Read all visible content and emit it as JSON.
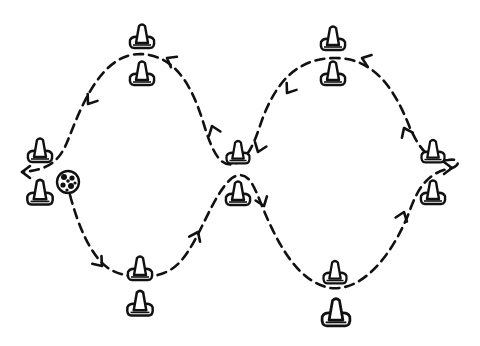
{
  "diagram": {
    "title": "Figure-eight dribbling drill through cone gates",
    "background": "#ffffff",
    "ink_color": "#111111",
    "ball": {
      "icon": "soccer-ball-icon",
      "x": 68,
      "y": 182,
      "r": 11
    },
    "cones": [
      {
        "id": "left-top",
        "x": 40,
        "y": 150,
        "size": 1.0
      },
      {
        "id": "left-bottom",
        "x": 40,
        "y": 192,
        "size": 1.05
      },
      {
        "id": "gate1-top-upper",
        "x": 142,
        "y": 36,
        "size": 1.0
      },
      {
        "id": "gate1-top-lower",
        "x": 142,
        "y": 73,
        "size": 1.0
      },
      {
        "id": "gate1-bottom-upper",
        "x": 140,
        "y": 268,
        "size": 1.0
      },
      {
        "id": "gate1-bottom-lower",
        "x": 140,
        "y": 303,
        "size": 1.05
      },
      {
        "id": "center-upper",
        "x": 238,
        "y": 152,
        "size": 0.95
      },
      {
        "id": "center-lower",
        "x": 238,
        "y": 193,
        "size": 1.0
      },
      {
        "id": "gate2-top-upper",
        "x": 333,
        "y": 38,
        "size": 1.0
      },
      {
        "id": "gate2-top-lower",
        "x": 333,
        "y": 73,
        "size": 1.0
      },
      {
        "id": "gate2-bottom-upper",
        "x": 335,
        "y": 272,
        "size": 0.95
      },
      {
        "id": "gate2-bottom-lower",
        "x": 336,
        "y": 312,
        "size": 1.15
      },
      {
        "id": "right-upper",
        "x": 433,
        "y": 151,
        "size": 0.95
      },
      {
        "id": "right-lower",
        "x": 433,
        "y": 192,
        "size": 1.0
      }
    ],
    "path": {
      "style": "dashed",
      "description": "Dribble path starting at ball, weaving down-right through gates in a figure-eight, looping around the right gate and returning left over the top, ending with arrow pointing left at the start gate.",
      "d": "M 70 195 C 78 225, 90 255, 108 268 C 122 278, 160 284, 180 262 C 200 240, 212 195, 232 178 C 248 168, 254 186, 262 206 C 280 250, 300 282, 330 288 C 365 292, 395 250, 410 210 C 418 188, 428 172, 452 168 C 462 164, 458 158, 448 160 C 430 162, 420 150, 410 128 C 395 90, 375 58, 335 58 C 295 58, 275 85, 262 120 C 255 140, 250 158, 234 164 C 220 168, 212 150, 205 128 C 195 95, 180 55, 140 54 C 100 54, 80 110, 68 140 C 60 160, 50 170, 22 172"
    },
    "arrows": [
      {
        "x": 102,
        "y": 266,
        "angle": 50,
        "label": "down-right"
      },
      {
        "x": 198,
        "y": 232,
        "angle": -65,
        "label": "up"
      },
      {
        "x": 264,
        "y": 206,
        "angle": 70,
        "label": "down"
      },
      {
        "x": 404,
        "y": 212,
        "angle": -70,
        "label": "up"
      },
      {
        "x": 452,
        "y": 168,
        "angle": 0,
        "label": "loop-right"
      },
      {
        "x": 404,
        "y": 128,
        "angle": -115,
        "label": "up-left"
      },
      {
        "x": 362,
        "y": 58,
        "angle": -160,
        "label": "left-top"
      },
      {
        "x": 287,
        "y": 93,
        "angle": 125,
        "label": "down-left"
      },
      {
        "x": 258,
        "y": 152,
        "angle": 110,
        "label": "down-left-center"
      },
      {
        "x": 212,
        "y": 126,
        "angle": -110,
        "label": "up-left"
      },
      {
        "x": 167,
        "y": 58,
        "angle": -150,
        "label": "up-left-top"
      },
      {
        "x": 88,
        "y": 104,
        "angle": 125,
        "label": "down-left"
      },
      {
        "x": 22,
        "y": 172,
        "angle": 180,
        "label": "left-end"
      }
    ]
  }
}
